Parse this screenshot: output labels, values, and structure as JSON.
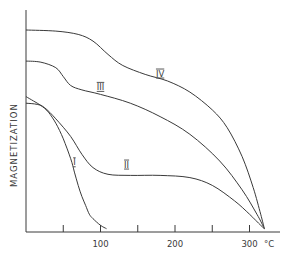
{
  "chart_data": {
    "type": "line",
    "title": "",
    "xlabel": "°C",
    "ylabel": "MAGNETIZATION",
    "xlim": [
      0,
      340
    ],
    "ylim": [
      0,
      100
    ],
    "x_ticks": [
      50,
      100,
      150,
      200,
      250,
      300
    ],
    "x_tick_labels": [
      "",
      "100",
      "",
      "200",
      "",
      "300"
    ],
    "x_unit_label": "°C",
    "grid": false,
    "legend": "none (curves labelled inline)",
    "series": [
      {
        "name": "I",
        "x": [
          0,
          10,
          20,
          30,
          40,
          50,
          60,
          65,
          70,
          75,
          80,
          85,
          90,
          100,
          108
        ],
        "y": [
          61,
          59,
          57,
          54,
          49,
          42,
          33,
          27,
          21,
          16,
          12,
          8,
          6,
          3,
          1.5
        ],
        "label_pos": [
          65,
          30
        ]
      },
      {
        "name": "II",
        "x": [
          0,
          15,
          25,
          40,
          60,
          75,
          90,
          110,
          140,
          180,
          220,
          250,
          280,
          300,
          315,
          320
        ],
        "y": [
          58,
          57.5,
          56,
          51,
          43,
          35,
          29,
          26,
          25.5,
          25.5,
          24.5,
          21,
          14,
          8,
          3,
          1.5
        ],
        "label_pos": [
          135,
          29
        ]
      },
      {
        "name": "III",
        "x": [
          0,
          20,
          40,
          50,
          60,
          75,
          100,
          140,
          180,
          220,
          260,
          290,
          310,
          320
        ],
        "y": [
          77,
          76.5,
          74,
          70,
          66,
          64,
          62,
          58,
          52,
          44,
          32,
          19,
          8,
          1.5
        ],
        "label_pos": [
          100,
          64
        ]
      },
      {
        "name": "IV",
        "x": [
          0,
          40,
          70,
          90,
          110,
          130,
          160,
          190,
          220,
          250,
          270,
          290,
          305,
          315,
          320
        ],
        "y": [
          91,
          90.5,
          89,
          86,
          80,
          75,
          71,
          68,
          63,
          55,
          47,
          34,
          20,
          8,
          1.5
        ],
        "label_pos": [
          180,
          70
        ]
      }
    ]
  }
}
